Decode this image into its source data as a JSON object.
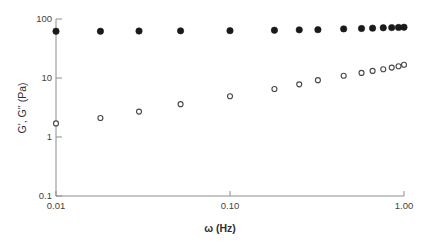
{
  "chart_data": {
    "type": "scatter",
    "title": "",
    "xlabel": "ω (Hz)",
    "ylabel": "G', G'' (Pa)",
    "xscale": "log",
    "yscale": "log",
    "xlim": [
      0.01,
      1.0
    ],
    "ylim": [
      0.1,
      100
    ],
    "grid": false,
    "legend": "none",
    "xticks": [
      0.01,
      0.1,
      1.0
    ],
    "xtick_labels": [
      "0.01",
      "0.10",
      "1.00"
    ],
    "yticks": [
      0.1,
      1,
      10,
      100
    ],
    "ytick_labels": [
      "0.1",
      "1",
      "10",
      "100"
    ],
    "series": [
      {
        "name": "G'",
        "marker": "filled-circle",
        "color": "#1a1a1a",
        "x": [
          0.01,
          0.018,
          0.03,
          0.052,
          0.1,
          0.18,
          0.25,
          0.32,
          0.45,
          0.57,
          0.66,
          0.76,
          0.85,
          0.93,
          1.0
        ],
        "y": [
          62.0,
          62.0,
          62.5,
          63.0,
          63.5,
          64.5,
          65.5,
          66.0,
          68.0,
          69.0,
          70.0,
          71.0,
          71.5,
          72.0,
          72.5
        ]
      },
      {
        "name": "G''",
        "marker": "open-circle",
        "color": "#4a4a4a",
        "x": [
          0.01,
          0.018,
          0.03,
          0.052,
          0.1,
          0.18,
          0.25,
          0.32,
          0.45,
          0.57,
          0.66,
          0.76,
          0.85,
          0.93,
          1.0
        ],
        "y": [
          1.7,
          2.1,
          2.7,
          3.6,
          4.9,
          6.5,
          7.8,
          9.2,
          10.9,
          12.2,
          13.2,
          14.1,
          15.0,
          15.8,
          16.8
        ]
      }
    ]
  },
  "axes": {
    "y_axis_title": "G', G'' (Pa)",
    "x_axis_title": "ω (Hz)"
  }
}
